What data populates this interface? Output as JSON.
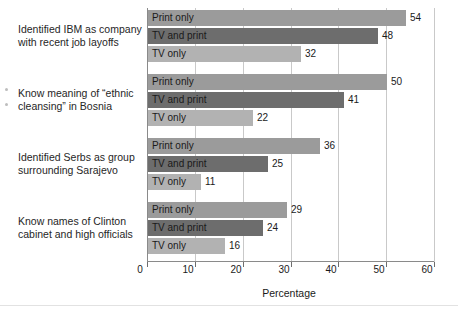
{
  "chart_data": {
    "type": "bar",
    "orientation": "horizontal",
    "title": "",
    "xlabel": "Percentage",
    "ylabel": "",
    "xlim": [
      0,
      60
    ],
    "xticks": [
      0,
      10,
      20,
      30,
      40,
      50,
      60
    ],
    "grid": true,
    "legend": "in-bar labels",
    "series_names": [
      "Print only",
      "TV and print",
      "TV only"
    ],
    "series_colors": [
      "#9b9b9b",
      "#6d6d6d",
      "#b2b2b2"
    ],
    "categories": [
      "Identified IBM as company with recent job layoffs",
      "Know meaning of “ethnic cleansing” in Bosnia",
      "Identified Serbs as group surrounding Sarajevo",
      "Know names of Clinton cabinet and high officials"
    ],
    "series": [
      {
        "name": "Print only",
        "values": [
          54,
          50,
          36,
          29
        ]
      },
      {
        "name": "TV and print",
        "values": [
          48,
          41,
          25,
          24
        ]
      },
      {
        "name": "TV only",
        "values": [
          32,
          22,
          11,
          16
        ]
      }
    ],
    "groups": [
      {
        "category_line1": "Identified IBM as company",
        "category_line2": "with recent job layoffs",
        "bars": [
          {
            "label": "Print only",
            "value": 54,
            "value_text": "54",
            "color": "#9b9b9b"
          },
          {
            "label": "TV and print",
            "value": 48,
            "value_text": "48",
            "color": "#6d6d6d"
          },
          {
            "label": "TV only",
            "value": 32,
            "value_text": "32",
            "color": "#b2b2b2"
          }
        ]
      },
      {
        "category_line1": "Know meaning of “ethnic",
        "category_line2": "cleansing” in Bosnia",
        "bars": [
          {
            "label": "Print only",
            "value": 50,
            "value_text": "50",
            "color": "#9b9b9b"
          },
          {
            "label": "TV and print",
            "value": 41,
            "value_text": "41",
            "color": "#6d6d6d"
          },
          {
            "label": "TV only",
            "value": 22,
            "value_text": "22",
            "color": "#b2b2b2"
          }
        ]
      },
      {
        "category_line1": "Identified Serbs as group",
        "category_line2": "surrounding Sarajevo",
        "bars": [
          {
            "label": "Print only",
            "value": 36,
            "value_text": "36",
            "color": "#9b9b9b"
          },
          {
            "label": "TV and print",
            "value": 25,
            "value_text": "25",
            "color": "#6d6d6d"
          },
          {
            "label": "TV only",
            "value": 11,
            "value_text": "11",
            "color": "#b2b2b2"
          }
        ]
      },
      {
        "category_line1": "Know names of Clinton",
        "category_line2": "cabinet and high officials",
        "bars": [
          {
            "label": "Print only",
            "value": 29,
            "value_text": "29",
            "color": "#9b9b9b"
          },
          {
            "label": "TV and print",
            "value": 24,
            "value_text": "24",
            "color": "#6d6d6d"
          },
          {
            "label": "TV only",
            "value": 16,
            "value_text": "16",
            "color": "#b2b2b2"
          }
        ]
      }
    ],
    "xtick_labels": [
      "0",
      "10",
      "20",
      "30",
      "40",
      "50",
      "60"
    ]
  }
}
